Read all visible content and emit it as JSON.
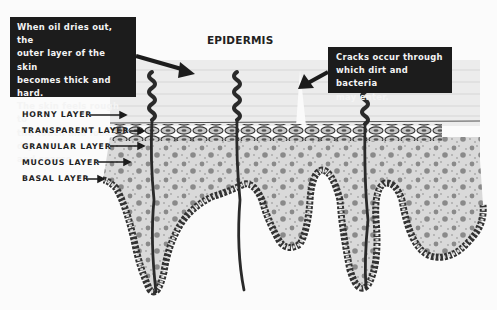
{
  "title": "EPIDERMIS",
  "callouts": {
    "left": [
      "When oil dries out, the",
      "outer layer of the skin",
      "becomes thick and hard.",
      "The skin feels rough to",
      "the touch and looks dry",
      "and coarse."
    ],
    "right": [
      "Cracks occur through",
      "which dirt and bacteria",
      "may enter."
    ]
  },
  "layers": [
    {
      "label": "HORNY LAYER"
    },
    {
      "label": "TRANSPARENT LAYER"
    },
    {
      "label": "GRANULAR LAYER"
    },
    {
      "label": "MUCOUS LAYER"
    },
    {
      "label": "BASAL LAYER"
    }
  ],
  "colors": {
    "callout_bg": "#1c1c1c",
    "callout_text": "#f4f4f4",
    "stroke": "#2a2a2a",
    "stratum_fill": "#d9d9d9",
    "dot_fill": "#8a8a8a",
    "horny_fill": "#ececec"
  }
}
